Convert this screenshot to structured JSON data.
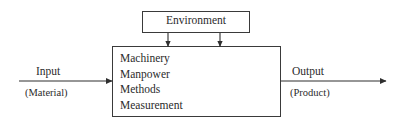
{
  "diagram": {
    "environment_box": {
      "label": "Environment",
      "x": 142,
      "y": 11,
      "width": 108,
      "height": 22
    },
    "process_box": {
      "x": 112,
      "y": 46,
      "width": 169,
      "height": 71,
      "factors": [
        {
          "label": "Machinery"
        },
        {
          "label": "Manpower"
        },
        {
          "label": "Methods"
        },
        {
          "label": "Measurement"
        }
      ]
    },
    "input": {
      "label": "Input",
      "sublabel": "(Material)"
    },
    "output": {
      "label": "Output",
      "sublabel": "(Product)"
    },
    "environment_arrows": [
      {
        "x": 168,
        "from_y": 33,
        "to_y": 46
      },
      {
        "x": 220,
        "from_y": 33,
        "to_y": 46
      }
    ],
    "flow_arrows": [
      {
        "name": "input-arrow",
        "x1": 19,
        "y1": 81,
        "x2": 112,
        "y2": 81
      },
      {
        "name": "output-arrow",
        "x1": 281,
        "y1": 81,
        "x2": 386,
        "y2": 81
      }
    ],
    "colors": {
      "stroke": "#3a3a3a",
      "text": "#2b2b2b",
      "background": "#ffffff"
    }
  }
}
